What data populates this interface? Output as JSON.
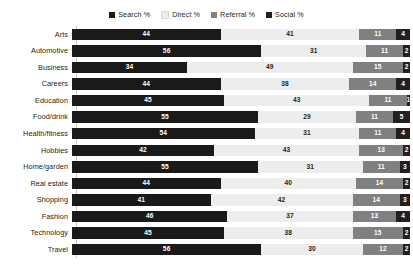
{
  "chart_data": {
    "type": "bar",
    "orientation": "horizontal",
    "stacked": true,
    "stack_mode": "percent",
    "title": "",
    "subtitle": "",
    "xlabel": "",
    "ylabel": "",
    "xlim": [
      0,
      100
    ],
    "grid": false,
    "legend_position": "top-center",
    "categories": [
      "Arts",
      "Automotive",
      "Business",
      "Careers",
      "Education",
      "Food/drink",
      "Health/fitness",
      "Hobbies",
      "Home/garden",
      "Real estate",
      "Shopping",
      "Fashion",
      "Technology",
      "Travel"
    ],
    "series": [
      {
        "name": "Search %",
        "color": "#1a1a1a",
        "values": [
          44,
          56,
          34,
          44,
          45,
          55,
          54,
          42,
          55,
          44,
          41,
          46,
          45,
          56
        ]
      },
      {
        "name": "Direct %",
        "color": "#ededed",
        "values": [
          41,
          31,
          49,
          38,
          43,
          29,
          31,
          43,
          31,
          40,
          42,
          37,
          38,
          30
        ]
      },
      {
        "name": "Referral %",
        "color": "#808080",
        "values": [
          11,
          11,
          15,
          14,
          11,
          11,
          11,
          13,
          11,
          14,
          14,
          13,
          15,
          12
        ]
      },
      {
        "name": "Social %",
        "color": "#231f20",
        "values": [
          4,
          2,
          2,
          4,
          1,
          5,
          4,
          2,
          3,
          2,
          3,
          4,
          2,
          2
        ]
      }
    ]
  },
  "legend": {
    "items": [
      {
        "label": "Search %",
        "color": "#1a1a1a",
        "icon": "square-swatch-icon"
      },
      {
        "label": "Direct %",
        "color": "#ededed",
        "icon": "square-swatch-icon"
      },
      {
        "label": "Referral %",
        "color": "#808080",
        "icon": "square-swatch-icon"
      },
      {
        "label": "Social %",
        "color": "#231f20",
        "icon": "square-swatch-icon"
      }
    ]
  },
  "colors": {
    "background": "#ffffff",
    "axis": "#c9c9c9",
    "text": "#231f20",
    "series_search": "#1a1a1a",
    "series_direct": "#ededed",
    "series_referral": "#808080",
    "series_social": "#231f20"
  }
}
